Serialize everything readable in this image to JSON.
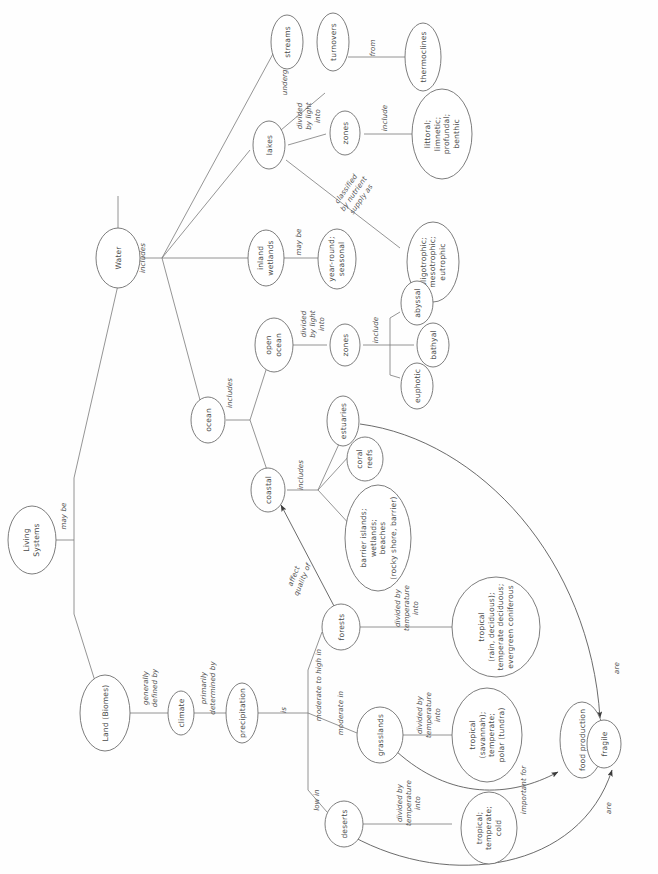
{
  "diagram": {
    "orientation": "rotated-90-ccw",
    "colors": {
      "node_stroke": "#6e6e6e",
      "edge_stroke": "#7a7a7a",
      "text": "#4a4a4a",
      "background": "#fefefe"
    },
    "nodes": [
      {
        "id": "living_systems",
        "label": "Living\nSystems"
      },
      {
        "id": "water",
        "label": "Water"
      },
      {
        "id": "land_biomes",
        "label": "Land (Biomes)"
      },
      {
        "id": "streams",
        "label": "streams"
      },
      {
        "id": "lakes",
        "label": "lakes"
      },
      {
        "id": "turnovers",
        "label": "turnovers"
      },
      {
        "id": "thermoclines",
        "label": "thermoclines"
      },
      {
        "id": "lake_zones",
        "label": "zones"
      },
      {
        "id": "lake_zone_list",
        "label": "littoral;\nlimnetic;\nprofundal;\nbenthic"
      },
      {
        "id": "trophic",
        "label": "oligotrophic;\nmesotrophic;\neutrophic"
      },
      {
        "id": "inland_wetlands",
        "label": "inland\nwetlands"
      },
      {
        "id": "wetland_types",
        "label": "year-round;\nseasonal"
      },
      {
        "id": "ocean",
        "label": "ocean"
      },
      {
        "id": "open_ocean",
        "label": "open\nocean"
      },
      {
        "id": "ocean_zones",
        "label": "zones"
      },
      {
        "id": "abyssal",
        "label": "abyssal"
      },
      {
        "id": "bathyal",
        "label": "bathyal"
      },
      {
        "id": "euphotic",
        "label": "euphotic"
      },
      {
        "id": "coastal",
        "label": "coastal"
      },
      {
        "id": "estuaries",
        "label": "estuaries"
      },
      {
        "id": "coral_reefs",
        "label": "coral\nreefs"
      },
      {
        "id": "barrier_islands",
        "label": "barrier islands;\nwetlands;\nbeaches\n(rocky shore, barrier)"
      },
      {
        "id": "climate",
        "label": "climate"
      },
      {
        "id": "precipitation",
        "label": "precipitation"
      },
      {
        "id": "forests",
        "label": "forests"
      },
      {
        "id": "grasslands",
        "label": "grasslands"
      },
      {
        "id": "deserts",
        "label": "deserts"
      },
      {
        "id": "forest_types",
        "label": "tropical\n(rain, deciduous);\ntemperate deciduous;\nevergreen coniferous"
      },
      {
        "id": "grassland_types",
        "label": "tropical\n(savannah);\ntemperate;\npolar (tundra)"
      },
      {
        "id": "desert_types",
        "label": "tropical;\ntemperate;\ncold"
      },
      {
        "id": "food_production",
        "label": "food production"
      },
      {
        "id": "fragile",
        "label": "fragile"
      }
    ],
    "link_labels": [
      {
        "id": "may_be",
        "text": "may be"
      },
      {
        "id": "includes_water",
        "text": "includes"
      },
      {
        "id": "undergo",
        "text": "undergo"
      },
      {
        "id": "from",
        "text": "from"
      },
      {
        "id": "divided_by_light_into_lakes",
        "text": "divided\nby light\ninto"
      },
      {
        "id": "include_lake_zones",
        "text": "include"
      },
      {
        "id": "classified_by_nutrient",
        "text": "classified\nby nutrient\nsupply as"
      },
      {
        "id": "may_be_wetlands",
        "text": "may be"
      },
      {
        "id": "includes_ocean",
        "text": "includes"
      },
      {
        "id": "divided_by_light_into_ocean",
        "text": "divided\nby light\ninto"
      },
      {
        "id": "include_ocean_zones",
        "text": "include"
      },
      {
        "id": "includes_coastal",
        "text": "includes"
      },
      {
        "id": "affect_quality_of",
        "text": "affect\nquality of"
      },
      {
        "id": "generally_defined_by",
        "text": "generally\ndefined by"
      },
      {
        "id": "primarily_determined_by",
        "text": "primarily\ndetermined by"
      },
      {
        "id": "is",
        "text": "is"
      },
      {
        "id": "moderate_to_high_in",
        "text": "moderate to high in"
      },
      {
        "id": "moderate_in",
        "text": "moderate in"
      },
      {
        "id": "low_in",
        "text": "low in"
      },
      {
        "id": "divided_by_temp_forests",
        "text": "divided by\ntemperature\ninto"
      },
      {
        "id": "divided_by_temp_grass",
        "text": "divided by\ntemperature\ninto"
      },
      {
        "id": "divided_by_temp_desert",
        "text": "divided by\ntemperature\ninto"
      },
      {
        "id": "important_for",
        "text": "important for"
      },
      {
        "id": "are_top",
        "text": "are"
      },
      {
        "id": "are_bottom",
        "text": "are"
      }
    ]
  }
}
